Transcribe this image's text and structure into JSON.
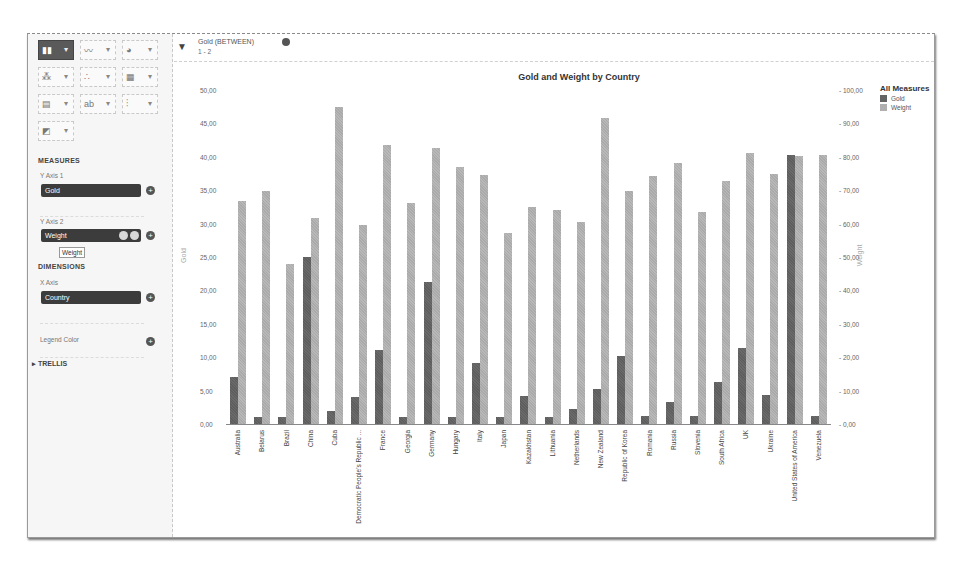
{
  "sidebar": {
    "chart_types": [
      {
        "name": "bar-chart",
        "active": true
      },
      {
        "name": "line-chart",
        "active": false
      },
      {
        "name": "pie-chart",
        "active": false
      },
      {
        "name": "scatter-chart",
        "active": false
      },
      {
        "name": "bubble-chart",
        "active": false
      },
      {
        "name": "heatmap-chart",
        "active": false
      },
      {
        "name": "pivot-table",
        "active": false
      },
      {
        "name": "tag-cloud",
        "active": false
      },
      {
        "name": "box-plot",
        "active": false
      },
      {
        "name": "combo-chart",
        "active": false
      }
    ],
    "measures_title": "MEASURES",
    "y_axis_1_label": "Y Axis 1",
    "y_axis_1_value": "Gold",
    "y_axis_2_label": "Y Axis 2",
    "y_axis_2_value": "Weight",
    "tooltip": "Weight",
    "dimensions_title": "DIMENSIONS",
    "x_axis_label": "X Axis",
    "x_axis_value": "Country",
    "legend_color_label": "Legend Color",
    "trellis_label": "TRELLIS"
  },
  "filter": {
    "title": "Gold (BETWEEN)",
    "value": "1 - 2"
  },
  "chart_data": {
    "type": "bar",
    "title": "Gold and Weight by Country",
    "xlabel": "Country",
    "ylabel": "Gold",
    "y2label": "Weight",
    "ylim": [
      0,
      50
    ],
    "y2lim": [
      0,
      100
    ],
    "yticks": [
      "50,00",
      "45,00",
      "40,00",
      "35,00",
      "30,00",
      "25,00",
      "20,00",
      "15,00",
      "10,00",
      "5,00",
      "0,00"
    ],
    "y2ticks": [
      "100,00",
      "90,00",
      "80,00",
      "70,00",
      "60,00",
      "50,00",
      "40,00",
      "30,00",
      "20,00",
      "10,00",
      "0,00"
    ],
    "legend_title": "All Measures",
    "legend_position": "right",
    "grid": false,
    "categories": [
      "Australia",
      "Belarus",
      "Brazil",
      "China",
      "Cuba",
      "Democratic People's Republic ...",
      "France",
      "Georgia",
      "Germany",
      "Hungary",
      "Italy",
      "Japan",
      "Kazakhstan",
      "Lithuania",
      "Netherlands",
      "New Zealand",
      "Republic of Korea",
      "Romania",
      "Russia",
      "Slovenia",
      "South Africa",
      "UK",
      "Ukraine",
      "United States of America",
      "Venezuela"
    ],
    "series": [
      {
        "name": "Gold",
        "axis": "left",
        "color": "#646464",
        "values": [
          7.0,
          1.0,
          1.0,
          25.0,
          2.0,
          4.1,
          11.1,
          1.0,
          21.2,
          1.1,
          9.1,
          1.1,
          4.2,
          1.1,
          2.2,
          5.2,
          10.2,
          1.2,
          3.3,
          1.2,
          6.3,
          11.4,
          4.4,
          40.3,
          1.2
        ]
      },
      {
        "name": "Weight",
        "axis": "right",
        "color": "#b0b0b0",
        "values": [
          66.8,
          69.8,
          48.0,
          61.7,
          94.8,
          59.5,
          83.5,
          66.1,
          82.7,
          77.0,
          74.7,
          57.3,
          65.0,
          64.1,
          60.6,
          91.5,
          69.7,
          74.3,
          78.1,
          63.4,
          72.8,
          81.1,
          74.9,
          80.3,
          80.5
        ]
      }
    ]
  }
}
